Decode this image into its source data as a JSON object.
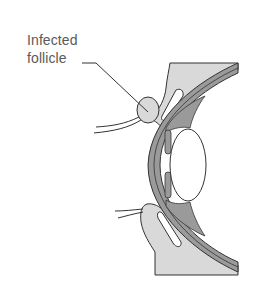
{
  "diagram": {
    "labels": [
      {
        "id": "infected-follicle",
        "line1": "Infected",
        "line2": "follicle"
      }
    ],
    "colors": {
      "background": "#ffffff",
      "lid_tissue": "#d9d9d9",
      "sclera_band": "#9a9a9a",
      "outline": "#333333",
      "label_text": "#5a5a5a",
      "lens": "#ffffff"
    }
  }
}
